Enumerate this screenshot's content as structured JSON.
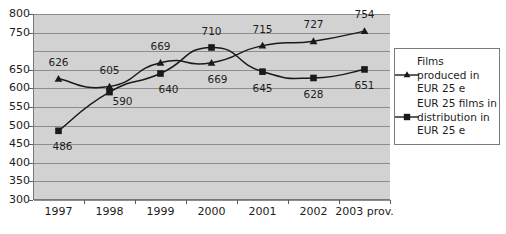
{
  "chart_data": {
    "type": "line",
    "title": "",
    "xlabel": "",
    "ylabel": "",
    "ylim": [
      300,
      800
    ],
    "grid": true,
    "legend_position": "right",
    "categories": [
      "1997",
      "1998",
      "1999",
      "2000",
      "2001",
      "2002",
      "2003 prov."
    ],
    "y_ticks": [
      "800",
      "750",
      "650",
      "600",
      "550",
      "500",
      "450",
      "400",
      "350",
      "300"
    ],
    "y_tick_values": [
      800,
      750,
      650,
      600,
      550,
      500,
      450,
      400,
      350,
      300
    ],
    "gridline_values": [
      800,
      750,
      700,
      650,
      600,
      550,
      500,
      450,
      400,
      350,
      300
    ],
    "series": [
      {
        "name": "Films produced in EUR 25 e",
        "marker": "triangle",
        "color": "#1a1a1a",
        "values": [
          626,
          605,
          669,
          669,
          715,
          727,
          754
        ],
        "labels": [
          "626",
          "605",
          "669",
          "669",
          "715",
          "727",
          "754"
        ]
      },
      {
        "name": "EUR 25 films in distribution in EUR 25 e",
        "marker": "square",
        "color": "#1a1a1a",
        "values": [
          486,
          590,
          640,
          710,
          645,
          628,
          651
        ],
        "labels": [
          "486",
          "590",
          "640",
          "710",
          "645",
          "628",
          "651"
        ]
      }
    ]
  },
  "legend": {
    "entries": [
      {
        "marker": "triangle",
        "line1": "Films",
        "line2": "produced in",
        "line3": "EUR 25 e"
      },
      {
        "marker": "square",
        "line1": "EUR 25 films in",
        "line2": "distribution in",
        "line3": "EUR 25 e"
      }
    ]
  },
  "colors": {
    "plot_background": "#d2d2d2",
    "gridline": "#8d8d8d",
    "series_line": "#1a1a1a",
    "axis": "#777777",
    "text": "#1d1d1d",
    "legend_background": "#ffffff",
    "legend_border": "#7a7a7a"
  }
}
